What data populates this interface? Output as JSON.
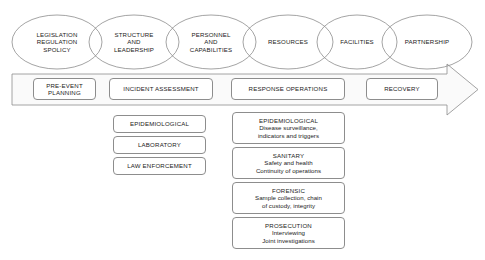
{
  "diagram": {
    "colors": {
      "stroke": "#8d8d8d",
      "band_fill": "#fafafa",
      "box_fill": "#ffffff",
      "text": "#1a1a1a",
      "page_background": "#ffffff"
    },
    "capability_ellipses": [
      {
        "id": "legislation",
        "lines": [
          "LEGISLATION",
          "REGULATION",
          "SPOLICY"
        ]
      },
      {
        "id": "structure",
        "lines": [
          "STRUCTURE",
          "AND",
          "LEADERSHIP"
        ]
      },
      {
        "id": "personnel",
        "lines": [
          "PERSONNEL",
          "AND",
          "CAPABILITIES"
        ]
      },
      {
        "id": "resources",
        "lines": [
          "RESOURCES"
        ]
      },
      {
        "id": "facilities",
        "lines": [
          "FACILITIES"
        ]
      },
      {
        "id": "partnership",
        "lines": [
          "PARTNERSHIP"
        ]
      }
    ],
    "phase_band": {
      "arrow_direction": "right",
      "phases": [
        {
          "id": "pre-event-planning",
          "label": "PRE-EVENT\nPLANNING"
        },
        {
          "id": "incident-assessment",
          "label": "INCIDENT ASSESSMENT"
        },
        {
          "id": "response-operations",
          "label": "RESPONSE OPERATIONS"
        },
        {
          "id": "recovery",
          "label": "RECOVERY"
        }
      ]
    },
    "assessment_disciplines": [
      {
        "id": "epidemiological",
        "title": "EPIDEMIOLOGICAL"
      },
      {
        "id": "laboratory",
        "title": "LABORATORY"
      },
      {
        "id": "law-enforcement",
        "title": "LAW ENFORCEMENT"
      }
    ],
    "response_disciplines": [
      {
        "id": "epidemiological",
        "title": "EPIDEMIOLOGICAL",
        "detail": "Disease surveillance,\nindicators and triggers"
      },
      {
        "id": "sanitary",
        "title": "SANITARY",
        "detail": "Safety and health\nContinuity of operations"
      },
      {
        "id": "forensic",
        "title": "FORENSIC",
        "detail": "Sample collection, chain\nof custody, integrity"
      },
      {
        "id": "prosecution",
        "title": "PROSECUTION",
        "detail": "Interviewing\nJoint investigations"
      }
    ]
  }
}
